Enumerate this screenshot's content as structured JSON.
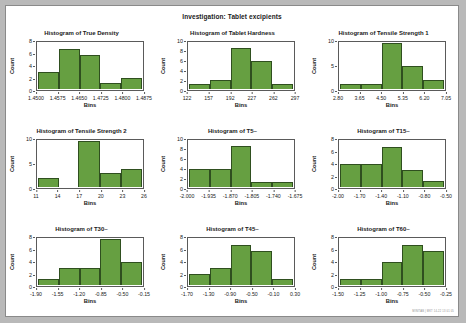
{
  "page": {
    "main_title": "Investigation: Tablet excipients",
    "watermark": "MINITAB | MKT 14-22 13 01 05",
    "bar_color": "#669f41",
    "bar_edge_color": "#2f4f1f",
    "background": "#ffffff"
  },
  "chart_data": [
    {
      "type": "bar",
      "title": "Histogram of True Density",
      "xlabel": "Bins",
      "ylabel": "Count",
      "categories": [
        "1.4500",
        "1.4575",
        "1.4650",
        "1.4725",
        "1.4800",
        "1.4875"
      ],
      "xticks": [
        "1.4500",
        "1.4575",
        "1.4650",
        "1.4725",
        "1.4800",
        "1.4875"
      ],
      "yticks": [
        0,
        2,
        4,
        6,
        8
      ],
      "ylim": [
        0,
        8
      ],
      "values": [
        3,
        7,
        6,
        1,
        2
      ],
      "grid": false,
      "legend": "none"
    },
    {
      "type": "bar",
      "title": "Histogram of Tablet Hardness",
      "xlabel": "Bins",
      "ylabel": "Count",
      "categories": [
        "122",
        "157",
        "192",
        "227",
        "262",
        "297"
      ],
      "xticks": [
        "122",
        "157",
        "192",
        "227",
        "262",
        "297"
      ],
      "yticks": [
        0,
        2,
        4,
        6,
        8,
        10
      ],
      "ylim": [
        0,
        10
      ],
      "values": [
        1,
        2,
        9,
        6,
        1
      ],
      "grid": false,
      "legend": "none"
    },
    {
      "type": "bar",
      "title": "Histogram of Tensile Strength 1",
      "xlabel": "Bins",
      "ylabel": "Count",
      "categories": [
        "2.80",
        "3.65",
        "4.50",
        "5.35",
        "6.20",
        "7.05"
      ],
      "xticks": [
        "2.80",
        "3.65",
        "4.50",
        "5.35",
        "6.20",
        "7.05"
      ],
      "yticks": [
        0,
        5,
        10
      ],
      "ylim": [
        0,
        10
      ],
      "values": [
        1,
        1,
        10,
        5,
        2
      ],
      "grid": false,
      "legend": "none"
    },
    {
      "type": "bar",
      "title": "Histogram of Tensile Strength 2",
      "xlabel": "Bins",
      "ylabel": "Count",
      "categories": [
        "11",
        "14",
        "17",
        "20",
        "23",
        "26"
      ],
      "xticks": [
        "11",
        "14",
        "17",
        "20",
        "23",
        "26"
      ],
      "yticks": [
        0,
        5,
        10
      ],
      "ylim": [
        0,
        10
      ],
      "values": [
        2,
        0,
        10,
        3,
        4
      ],
      "grid": false,
      "legend": "none"
    },
    {
      "type": "bar",
      "title": "Histogram of T5~",
      "xlabel": "Bins",
      "ylabel": "Count",
      "categories": [
        "-2.000",
        "-1.935",
        "-1.870",
        "-1.805",
        "-1.740",
        "-1.675"
      ],
      "xticks": [
        "-2.000",
        "-1.935",
        "-1.870",
        "-1.805",
        "-1.740",
        "-1.675"
      ],
      "yticks": [
        0,
        2,
        4,
        6,
        8,
        10
      ],
      "ylim": [
        0,
        10
      ],
      "values": [
        4,
        4,
        9,
        1,
        1
      ],
      "grid": false,
      "legend": "none"
    },
    {
      "type": "bar",
      "title": "Histogram of T15~",
      "xlabel": "Bins",
      "ylabel": "Count",
      "categories": [
        "-2.00",
        "-1.70",
        "-1.40",
        "-1.10",
        "-0.80",
        "-0.50"
      ],
      "xticks": [
        "-2.00",
        "-1.70",
        "-1.40",
        "-1.10",
        "-0.80",
        "-0.50"
      ],
      "yticks": [
        0,
        2,
        4,
        6,
        8
      ],
      "ylim": [
        0,
        8
      ],
      "values": [
        4,
        4,
        7,
        3,
        1
      ],
      "grid": false,
      "legend": "none"
    },
    {
      "type": "bar",
      "title": "Histogram of T30~",
      "xlabel": "Bins",
      "ylabel": "Count",
      "categories": [
        "-1.90",
        "-1.55",
        "-1.20",
        "-0.85",
        "-0.50",
        "-0.15"
      ],
      "xticks": [
        "-1.90",
        "-1.55",
        "-1.20",
        "-0.85",
        "-0.50",
        "-0.15"
      ],
      "yticks": [
        0,
        2,
        4,
        6,
        8
      ],
      "ylim": [
        0,
        8
      ],
      "values": [
        1,
        3,
        3,
        8,
        4
      ],
      "grid": false,
      "legend": "none"
    },
    {
      "type": "bar",
      "title": "Histogram of T45~",
      "xlabel": "Bins",
      "ylabel": "Count",
      "categories": [
        "-1.70",
        "-1.30",
        "-0.90",
        "-0.50",
        "-0.10",
        "0.30"
      ],
      "xticks": [
        "-1.70",
        "-1.30",
        "-0.90",
        "-0.50",
        "-0.10",
        "0.30"
      ],
      "yticks": [
        0,
        2,
        4,
        6,
        8
      ],
      "ylim": [
        0,
        8
      ],
      "values": [
        2,
        3,
        7,
        6,
        1
      ],
      "grid": false,
      "legend": "none"
    },
    {
      "type": "bar",
      "title": "Histogram of T60~",
      "xlabel": "Bins",
      "ylabel": "Count",
      "categories": [
        "-1.50",
        "-1.25",
        "-1.00",
        "-0.75",
        "-0.50",
        "-0.25"
      ],
      "xticks": [
        "-1.50",
        "-1.25",
        "-1.00",
        "-0.75",
        "-0.50",
        "-0.25"
      ],
      "yticks": [
        0,
        2,
        4,
        6,
        8
      ],
      "ylim": [
        0,
        8
      ],
      "values": [
        1,
        1,
        4,
        7,
        6
      ],
      "grid": false,
      "legend": "none"
    }
  ]
}
